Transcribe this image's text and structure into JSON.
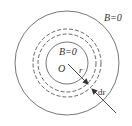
{
  "diagram": {
    "labels": {
      "outer_field": "B=0",
      "inner_field": "B=0",
      "center": "O",
      "radius": "r",
      "thickness": "dr"
    },
    "geometry": {
      "center": [
        67,
        63
      ],
      "outer_radius": 52,
      "inner_radius": 21,
      "dashed_radii": [
        29,
        34
      ]
    },
    "colors": {
      "stroke": "#555555",
      "text": "#333333",
      "background": "#ffffff"
    }
  }
}
